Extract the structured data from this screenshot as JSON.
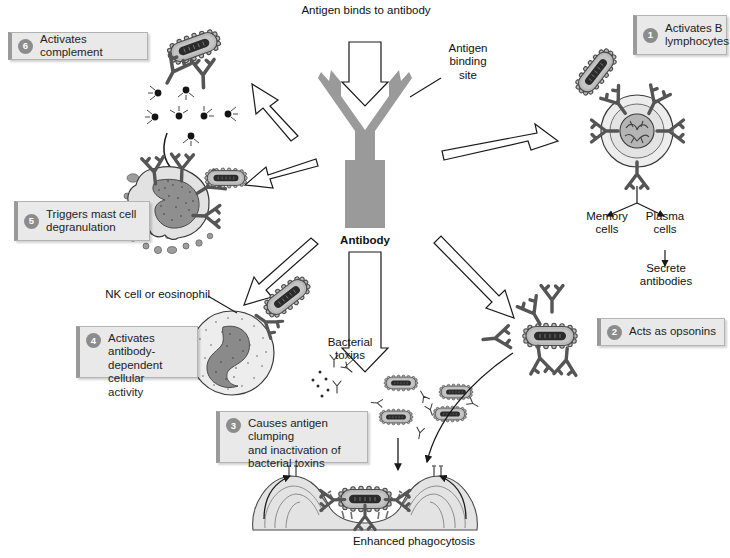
{
  "diagram": {
    "center_label": "Antibody",
    "top_label": "Antigen binds to antibody",
    "binding_site_label": "Antigen\nbinding\nsite",
    "binding_site_l1": "Antigen",
    "binding_site_l2": "binding",
    "binding_site_l3": "site",
    "bottom_label": "Enhanced phagocytosis",
    "bacterial_toxins_l1": "Bacterial",
    "bacterial_toxins_l2": "toxins",
    "nk_label": "NK cell or eosinophil",
    "memory_l1": "Memory",
    "memory_l2": "cells",
    "plasma_l1": "Plasma",
    "plasma_l2": "cells",
    "secrete_l1": "Secrete",
    "secrete_l2": "antibodies"
  },
  "callouts": [
    {
      "num": "1",
      "line1": "Activates B",
      "line2": "lymphocytes",
      "line3": ""
    },
    {
      "num": "2",
      "line1": "Acts as opsonins",
      "line2": "",
      "line3": ""
    },
    {
      "num": "3",
      "line1": "Causes antigen clumping",
      "line2": "and inactivation of",
      "line3": "bacterial toxins"
    },
    {
      "num": "4",
      "line1": "Activates antibody-",
      "line2": "dependent cellular",
      "line3": "activity"
    },
    {
      "num": "5",
      "line1": "Triggers mast cell",
      "line2": "degranulation",
      "line3": ""
    },
    {
      "num": "6",
      "line1": "Activates complement",
      "line2": "",
      "line3": ""
    }
  ],
  "colors": {
    "antibody_gray": "#9a9a9a",
    "bacterium_body": "#b9b9b9",
    "bacterium_core": "#2b2b2b",
    "cell_fill": "#e2e2e2",
    "nucleus": "#8f8f8f",
    "callout_bg": "#e9e9e9",
    "callout_border": "#b3b3b3",
    "num_badge": "#8c8c8c",
    "outline": "#2a2a2a",
    "phagocyte": "#dcdcdc"
  }
}
